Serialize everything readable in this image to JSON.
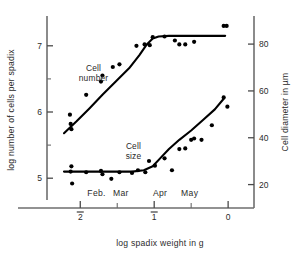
{
  "chart_data": {
    "type": "scatter",
    "title": "",
    "xlabel": "log spadix weight in g",
    "ylabel": "log number of cells per spadix",
    "y2label": "Cell diameter in µm",
    "xlim": [
      -2.45,
      0.35
    ],
    "ylim": [
      4.55,
      7.45
    ],
    "y2lim": [
      10,
      92
    ],
    "grid": false,
    "legend_position": "inline-annotation",
    "xticks": [
      -2,
      -1.5,
      -1,
      -0.5,
      0
    ],
    "xtick_labels": [
      "̅2",
      "",
      "̅1",
      "",
      "0"
    ],
    "xtick_labels_plain": [
      "-2",
      "",
      "-1",
      "",
      "0"
    ],
    "yticks": [
      5,
      5.5,
      6,
      6.5,
      7
    ],
    "ytick_labels": [
      "5",
      "",
      "6",
      "",
      "7"
    ],
    "y2ticks": [
      20,
      40,
      60,
      80
    ],
    "y2tick_labels": [
      "20",
      "40",
      "60",
      "80"
    ],
    "month_annotations": [
      {
        "label": "Feb.",
        "x": -1.78
      },
      {
        "label": "Mar",
        "x": -1.45
      },
      {
        "label": "Apr",
        "x": -0.92
      },
      {
        "label": "May",
        "x": -0.52
      }
    ],
    "series": [
      {
        "name": "Cell number",
        "axis": "left",
        "label_x": -1.82,
        "label_y": 6.62,
        "points": [
          {
            "x": -2.14,
            "y": 5.96
          },
          {
            "x": -2.13,
            "y": 5.82
          },
          {
            "x": -2.12,
            "y": 5.74
          },
          {
            "x": -1.92,
            "y": 6.26
          },
          {
            "x": -1.72,
            "y": 6.46
          },
          {
            "x": -1.7,
            "y": 6.55
          },
          {
            "x": -1.56,
            "y": 6.68
          },
          {
            "x": -1.47,
            "y": 6.72
          },
          {
            "x": -1.24,
            "y": 7.0
          },
          {
            "x": -1.13,
            "y": 7.02
          },
          {
            "x": -1.06,
            "y": 7.01
          },
          {
            "x": -1.02,
            "y": 7.13
          },
          {
            "x": -0.86,
            "y": 7.14
          },
          {
            "x": -0.72,
            "y": 7.08
          },
          {
            "x": -0.66,
            "y": 7.02
          },
          {
            "x": -0.58,
            "y": 7.02
          },
          {
            "x": -0.46,
            "y": 7.06
          },
          {
            "x": -0.06,
            "y": 7.3
          },
          {
            "x": -0.02,
            "y": 7.3
          }
        ],
        "fit_curve": [
          {
            "x": -2.22,
            "y": 5.68
          },
          {
            "x": -2.05,
            "y": 5.86
          },
          {
            "x": -1.88,
            "y": 6.05
          },
          {
            "x": -1.7,
            "y": 6.26
          },
          {
            "x": -1.52,
            "y": 6.46
          },
          {
            "x": -1.34,
            "y": 6.66
          },
          {
            "x": -1.2,
            "y": 6.86
          },
          {
            "x": -1.1,
            "y": 7.02
          },
          {
            "x": -1.02,
            "y": 7.11
          },
          {
            "x": -0.94,
            "y": 7.14
          },
          {
            "x": -0.8,
            "y": 7.15
          },
          {
            "x": -0.4,
            "y": 7.15
          },
          {
            "x": -0.04,
            "y": 7.15
          }
        ]
      },
      {
        "name": "Cell size",
        "axis": "right",
        "label_x": -1.28,
        "label_y": 5.44,
        "points": [
          {
            "x": -2.13,
            "y": 5.1
          },
          {
            "x": -2.12,
            "y": 5.18
          },
          {
            "x": -2.11,
            "y": 4.92
          },
          {
            "x": -1.92,
            "y": 5.09
          },
          {
            "x": -1.72,
            "y": 5.11
          },
          {
            "x": -1.7,
            "y": 5.06
          },
          {
            "x": -1.58,
            "y": 4.99
          },
          {
            "x": -1.47,
            "y": 5.09
          },
          {
            "x": -1.3,
            "y": 5.08
          },
          {
            "x": -1.22,
            "y": 5.12
          },
          {
            "x": -1.12,
            "y": 5.09
          },
          {
            "x": -1.07,
            "y": 5.26
          },
          {
            "x": -0.99,
            "y": 5.19
          },
          {
            "x": -0.86,
            "y": 5.3
          },
          {
            "x": -0.76,
            "y": 5.12
          },
          {
            "x": -0.66,
            "y": 5.44
          },
          {
            "x": -0.58,
            "y": 5.45
          },
          {
            "x": -0.5,
            "y": 5.58
          },
          {
            "x": -0.46,
            "y": 5.6
          },
          {
            "x": -0.36,
            "y": 5.58
          },
          {
            "x": -0.22,
            "y": 5.8
          },
          {
            "x": -0.06,
            "y": 6.22
          },
          {
            "x": -0.01,
            "y": 6.08
          }
        ],
        "fit_curve": [
          {
            "x": -2.22,
            "y": 5.1
          },
          {
            "x": -1.9,
            "y": 5.1
          },
          {
            "x": -1.6,
            "y": 5.1
          },
          {
            "x": -1.3,
            "y": 5.1
          },
          {
            "x": -1.14,
            "y": 5.12
          },
          {
            "x": -1.02,
            "y": 5.18
          },
          {
            "x": -0.92,
            "y": 5.3
          },
          {
            "x": -0.8,
            "y": 5.44
          },
          {
            "x": -0.66,
            "y": 5.58
          },
          {
            "x": -0.5,
            "y": 5.72
          },
          {
            "x": -0.34,
            "y": 5.88
          },
          {
            "x": -0.18,
            "y": 6.04
          },
          {
            "x": -0.06,
            "y": 6.2
          }
        ]
      }
    ]
  }
}
